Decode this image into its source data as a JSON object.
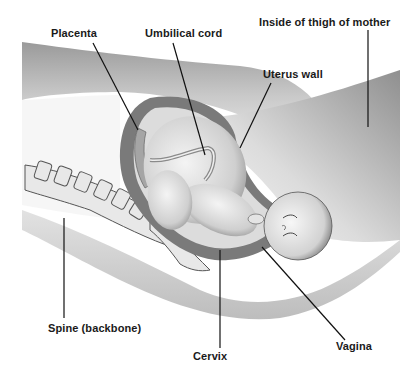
{
  "diagram": {
    "type": "anatomical-illustration",
    "labels": [
      {
        "id": "placenta",
        "text": "Placenta"
      },
      {
        "id": "umbilical-cord",
        "text": "Umbilical cord"
      },
      {
        "id": "inside-of-thigh",
        "text": "Inside of thigh of mother"
      },
      {
        "id": "uterus-wall",
        "text": "Uterus wall"
      },
      {
        "id": "spine",
        "text": "Spine (backbone)"
      },
      {
        "id": "cervix",
        "text": "Cervix"
      },
      {
        "id": "vagina",
        "text": "Vagina"
      }
    ],
    "colors": {
      "background": "#ffffff",
      "body_shade_dark": "#8a8a8a",
      "body_shade_light": "#e6e6e6",
      "uterus_wall": "#6e6e6e",
      "line": "#111111",
      "text": "#1a1a1a"
    }
  }
}
